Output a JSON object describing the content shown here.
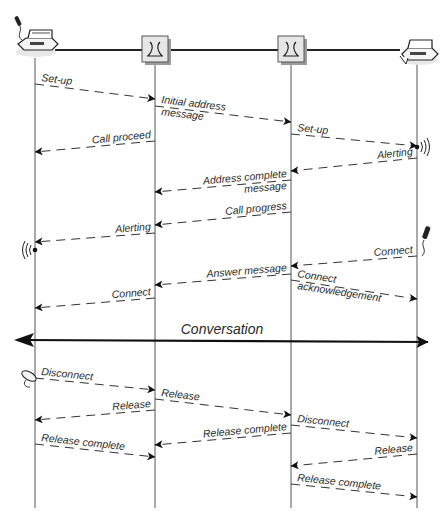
{
  "diagram": {
    "type": "sequence",
    "title": "",
    "colors": {
      "line": "#3a3a3a",
      "arrowhead": "#111111",
      "exchange_fill": "#e6e6e6",
      "exchange_shadow": "#9a9a9a",
      "text": "#2a2a2a"
    },
    "participants": [
      {
        "id": "caller",
        "name": "Calling telephone",
        "icon": "telephone-icon",
        "x": 35
      },
      {
        "id": "exchange_a",
        "name": "Originating exchange",
        "icon": "switch-icon",
        "x": 155
      },
      {
        "id": "exchange_b",
        "name": "Terminating exchange",
        "icon": "switch-icon",
        "x": 291
      },
      {
        "id": "callee",
        "name": "Called telephone",
        "icon": "telephone-icon",
        "x": 417
      }
    ],
    "messages": [
      {
        "id": "m1",
        "label": "Set-up",
        "from": "caller",
        "to": "exchange_a",
        "y1": 84,
        "y2": 99
      },
      {
        "id": "m2",
        "label": "Initial address",
        "label2": "message",
        "from": "exchange_a",
        "to": "exchange_b",
        "y1": 106,
        "y2": 122
      },
      {
        "id": "m3",
        "label": "Set-up",
        "from": "exchange_b",
        "to": "callee",
        "y1": 134,
        "y2": 146
      },
      {
        "id": "m4",
        "label": "Call proceed",
        "from": "exchange_a",
        "to": "caller",
        "y1": 141,
        "y2": 152
      },
      {
        "id": "m5",
        "label": "Alerting",
        "from": "callee",
        "to": "exchange_b",
        "y1": 158,
        "y2": 171
      },
      {
        "id": "m6",
        "label": "Address complete",
        "label2": "message",
        "from": "exchange_b",
        "to": "exchange_a",
        "y1": 180,
        "y2": 192
      },
      {
        "id": "m7",
        "label": "Call progress",
        "from": "exchange_b",
        "to": "exchange_a",
        "y1": 212,
        "y2": 225
      },
      {
        "id": "m8",
        "label": "Alerting",
        "from": "exchange_a",
        "to": "caller",
        "y1": 233,
        "y2": 242
      },
      {
        "id": "m9",
        "label": "Connect",
        "from": "callee",
        "to": "exchange_b",
        "y1": 256,
        "y2": 266
      },
      {
        "id": "m10",
        "label": "Answer message",
        "from": "exchange_b",
        "to": "exchange_a",
        "y1": 274,
        "y2": 285
      },
      {
        "id": "m11",
        "label": "Connect",
        "label2": "acknowledgement",
        "from": "exchange_b",
        "to": "callee",
        "y1": 280,
        "y2": 299
      },
      {
        "id": "m12",
        "label": "Connect",
        "from": "exchange_a",
        "to": "caller",
        "y1": 298,
        "y2": 308
      },
      {
        "id": "m13",
        "label": "Disconnect",
        "from": "caller",
        "to": "exchange_a",
        "y1": 378,
        "y2": 390
      },
      {
        "id": "m14",
        "label": "Release",
        "from": "exchange_a",
        "to": "exchange_b",
        "y1": 399,
        "y2": 415
      },
      {
        "id": "m15",
        "label": "Release",
        "from": "exchange_a",
        "to": "caller",
        "y1": 410,
        "y2": 420
      },
      {
        "id": "m16",
        "label": "Release complete",
        "from": "exchange_b",
        "to": "exchange_a",
        "y1": 433,
        "y2": 445
      },
      {
        "id": "m17",
        "label": "Disconnect",
        "from": "exchange_b",
        "to": "callee",
        "y1": 425,
        "y2": 438
      },
      {
        "id": "m18",
        "label": "Release complete",
        "from": "caller",
        "to": "exchange_a",
        "y1": 444,
        "y2": 457
      },
      {
        "id": "m19",
        "label": "Release",
        "from": "callee",
        "to": "exchange_b",
        "y1": 454,
        "y2": 466
      },
      {
        "id": "m20",
        "label": "Release complete",
        "from": "exchange_b",
        "to": "callee",
        "y1": 484,
        "y2": 497
      }
    ],
    "conversation": {
      "label": "Conversation",
      "y": 341,
      "bidirectional": true
    },
    "annotations": [
      {
        "type": "ringing-icon",
        "at": "callee",
        "y": 147
      },
      {
        "type": "ringing-icon",
        "at": "caller",
        "y": 244
      },
      {
        "type": "handset-lifted-icon",
        "at": "callee",
        "y": 250
      },
      {
        "type": "handset-replaced-icon",
        "at": "caller",
        "y": 376
      }
    ]
  }
}
